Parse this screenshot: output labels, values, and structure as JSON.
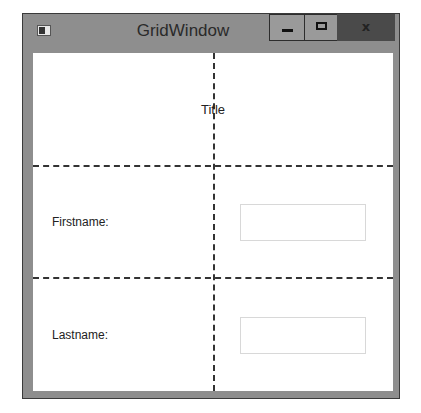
{
  "window": {
    "title": "GridWindow",
    "icon": "app-window-icon",
    "controls": {
      "minimize": "minimize-icon",
      "maximize": "maximize-icon",
      "close": "close-icon",
      "close_glyph": "x"
    }
  },
  "grid": {
    "rows": 3,
    "columns": 2,
    "show_grid_lines": true
  },
  "content": {
    "title_label": "Title",
    "firstname_label": "Firstname:",
    "firstname_value": "",
    "lastname_label": "Lastname:",
    "lastname_value": ""
  }
}
